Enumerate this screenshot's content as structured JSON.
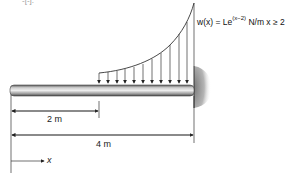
{
  "figure": {
    "cut_text_top": "-[-].",
    "load": {
      "formula_lhs": "w(x) = Le",
      "formula_exp": "(x−2)",
      "formula_units": " N/m",
      "formula_condition": "  x ≥ 2",
      "arrow_count": 11,
      "start_x_m": 2,
      "end_x_m": 4
    },
    "dimensions": {
      "short_label": "2 m",
      "long_label": "4 m"
    },
    "axis": {
      "x_label": "x"
    },
    "colors": {
      "line": "#222222",
      "beam_light": "#e6e6e6",
      "beam_dark": "#6a6a6a",
      "wall_shade": "#9a9a9a"
    }
  }
}
